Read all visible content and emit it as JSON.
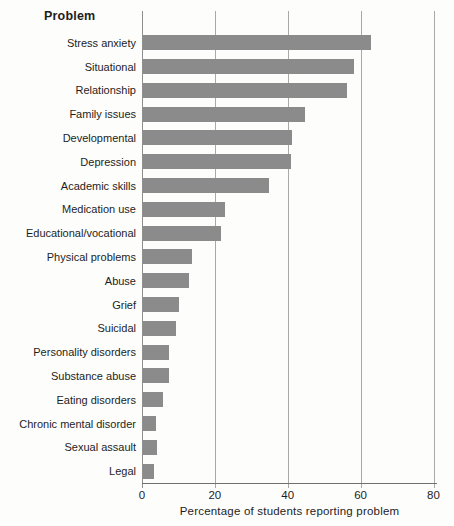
{
  "chart": {
    "title": "Problem",
    "xlabel": "Percentage of students reporting problem"
  },
  "chart_data": {
    "type": "bar",
    "orientation": "horizontal",
    "title": "Problem",
    "xlabel": "Percentage of students reporting problem",
    "categories": [
      "Stress anxiety",
      "Situational",
      "Relationship",
      "Family issues",
      "Developmental",
      "Depression",
      "Academic skills",
      "Medication use",
      "Educational/vocational",
      "Physical problems",
      "Abuse",
      "Grief",
      "Suicidal",
      "Personality disorders",
      "Substance abuse",
      "Eating disorders",
      "Chronic mental disorder",
      "Sexual assault",
      "Legal"
    ],
    "values": [
      62.5,
      58,
      56,
      44.5,
      41,
      40.5,
      34.5,
      22.5,
      21.5,
      13.5,
      12.5,
      10,
      9,
      7.2,
      7,
      5.5,
      3.5,
      3.8,
      3
    ],
    "xticks": [
      0,
      20,
      40,
      60,
      80
    ],
    "xlim": [
      0,
      80
    ],
    "grid": true,
    "legend": false,
    "colors": {
      "bar": "#8b8b8b",
      "gridline": "#a9a9a9",
      "axis": "#707070",
      "text": "#1d1d1d",
      "background": "#fdfdfc"
    }
  }
}
